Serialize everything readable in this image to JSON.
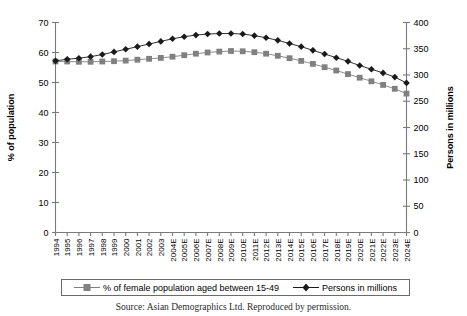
{
  "chart_data": {
    "type": "line",
    "title": "",
    "xlabel": "",
    "categories": [
      "1994",
      "1995",
      "1996",
      "1997",
      "1998",
      "1999",
      "2000",
      "2001",
      "2002",
      "2003",
      "2004E",
      "2005E",
      "2006E",
      "2007E",
      "2008E",
      "2009E",
      "2010E",
      "2011E",
      "2012E",
      "2013E",
      "2014E",
      "2015E",
      "2016E",
      "2017E",
      "2018E",
      "2019E",
      "2020E",
      "2021E",
      "2022E",
      "2023E",
      "2024E"
    ],
    "grid": false,
    "legend_position": "bottom",
    "axes": {
      "left": {
        "label": "% of population",
        "min": 0,
        "max": 70,
        "step": 10,
        "ticks": [
          "0",
          "10",
          "20",
          "30",
          "40",
          "50",
          "60",
          "70"
        ]
      },
      "right": {
        "label": "Persons in millions",
        "min": 0,
        "max": 400,
        "step": 50,
        "ticks": [
          "0",
          "50",
          "100",
          "150",
          "200",
          "250",
          "300",
          "350",
          "400"
        ]
      }
    },
    "series": [
      {
        "name": "% of female population aged between 15-49",
        "axis": "left",
        "marker": "square",
        "color": "#808080",
        "values": [
          57.0,
          57.0,
          56.9,
          56.9,
          57.0,
          57.1,
          57.3,
          57.6,
          57.9,
          58.2,
          58.6,
          59.1,
          59.6,
          60.0,
          60.3,
          60.5,
          60.4,
          60.1,
          59.6,
          58.9,
          58.1,
          57.2,
          56.2,
          55.1,
          54.0,
          52.8,
          51.6,
          50.4,
          49.2,
          47.9,
          46.3
        ]
      },
      {
        "name": "Persons in millions",
        "axis": "right",
        "marker": "diamond",
        "color": "#1a1a1a",
        "values": [
          327,
          330,
          332,
          335,
          339,
          344,
          349,
          354,
          359,
          364,
          369,
          373,
          376,
          378,
          379,
          379,
          378,
          375,
          371,
          366,
          360,
          354,
          347,
          340,
          333,
          326,
          318,
          311,
          304,
          296,
          285
        ]
      }
    ]
  },
  "caption": {
    "text": "Source: Asian Demographics Ltd. Reproduced by permission."
  },
  "legend": {
    "entries": [
      {
        "label": "% of female population aged between 15-49",
        "marker": "square-marker"
      },
      {
        "label": "Persons in millions",
        "marker": "diamond-marker"
      }
    ]
  }
}
